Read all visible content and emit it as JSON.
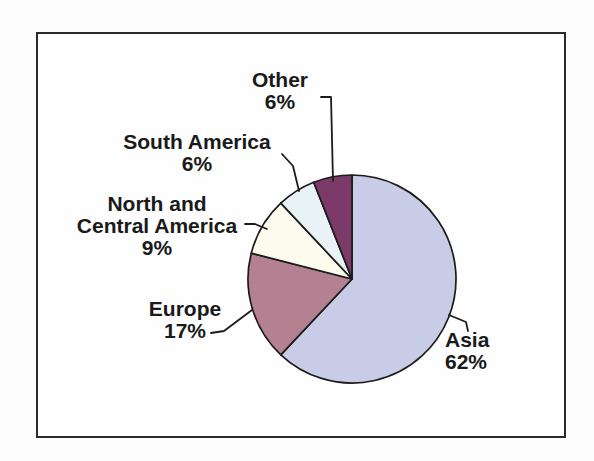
{
  "chart_data": {
    "type": "pie",
    "title": "",
    "categories": [
      "Asia",
      "Europe",
      "North and Central America",
      "South America",
      "Other"
    ],
    "values": [
      62,
      17,
      9,
      6,
      6
    ],
    "unit": "%",
    "start_angle_deg": 0,
    "direction": "clockwise",
    "legend": "none",
    "label_style": "outside-with-leader-lines",
    "outline_color": "#1c1c1c",
    "slices": [
      {
        "label": "Asia",
        "name_lines": [
          "Asia"
        ],
        "pct": "62%",
        "value": 62,
        "color": "#c9cce6"
      },
      {
        "label": "Europe",
        "name_lines": [
          "Europe"
        ],
        "pct": "17%",
        "value": 17,
        "color": "#b38191"
      },
      {
        "label": "North and Central America",
        "name_lines": [
          "North and",
          "Central America"
        ],
        "pct": "9%",
        "value": 9,
        "color": "#fcfcee"
      },
      {
        "label": "South America",
        "name_lines": [
          "South America"
        ],
        "pct": "6%",
        "value": 6,
        "color": "#e9f2f4"
      },
      {
        "label": "Other",
        "name_lines": [
          "Other"
        ],
        "pct": "6%",
        "value": 6,
        "color": "#7c3a69"
      }
    ]
  },
  "figure": {
    "frame_border_color": "#2a2a2a",
    "background_color": "#fefefe",
    "text_color": "#1a1a1a"
  }
}
